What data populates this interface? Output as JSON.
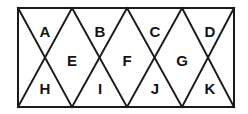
{
  "figure": {
    "name": "triangle-strip-diagram",
    "stroke_color": "#1a1a1a",
    "label_color": "#141414",
    "background_color": "#ffffff",
    "geometry": {
      "left": 18,
      "right": 234,
      "top": 8,
      "bottom": 107,
      "top_vertices_x": [
        18,
        72,
        127,
        182,
        234
      ],
      "bottom_vertices_x": [
        18,
        45,
        100,
        155,
        210,
        234
      ],
      "crossing_y": 57
    },
    "labels": [
      {
        "text": "A",
        "x": 45,
        "y": 31
      },
      {
        "text": "B",
        "x": 100,
        "y": 31
      },
      {
        "text": "C",
        "x": 155,
        "y": 31
      },
      {
        "text": "D",
        "x": 210,
        "y": 31
      },
      {
        "text": "E",
        "x": 72,
        "y": 60
      },
      {
        "text": "F",
        "x": 127,
        "y": 60
      },
      {
        "text": "G",
        "x": 182,
        "y": 60
      },
      {
        "text": "H",
        "x": 45,
        "y": 88
      },
      {
        "text": "I",
        "x": 100,
        "y": 88
      },
      {
        "text": "J",
        "x": 155,
        "y": 88
      },
      {
        "text": "K",
        "x": 210,
        "y": 88
      }
    ],
    "edges": [
      {
        "name": "top-edge",
        "x1": 18,
        "y1": 8,
        "x2": 234,
        "y2": 8
      },
      {
        "name": "bottom-edge",
        "x1": 18,
        "y1": 107,
        "x2": 234,
        "y2": 107
      },
      {
        "name": "left-edge",
        "x1": 18,
        "y1": 8,
        "x2": 18,
        "y2": 107
      },
      {
        "name": "right-edge",
        "x1": 234,
        "y1": 8,
        "x2": 234,
        "y2": 107
      },
      {
        "name": "diag-down-1",
        "x1": 18,
        "y1": 8,
        "x2": 72,
        "y2": 107
      },
      {
        "name": "diag-down-2",
        "x1": 72,
        "y1": 8,
        "x2": 127,
        "y2": 107
      },
      {
        "name": "diag-down-3",
        "x1": 127,
        "y1": 8,
        "x2": 182,
        "y2": 107
      },
      {
        "name": "diag-down-4",
        "x1": 182,
        "y1": 8,
        "x2": 234,
        "y2": 107
      },
      {
        "name": "diag-up-1",
        "x1": 72,
        "y1": 8,
        "x2": 18,
        "y2": 107
      },
      {
        "name": "diag-up-2",
        "x1": 127,
        "y1": 8,
        "x2": 72,
        "y2": 107
      },
      {
        "name": "diag-up-3",
        "x1": 182,
        "y1": 8,
        "x2": 127,
        "y2": 107
      },
      {
        "name": "diag-up-4",
        "x1": 234,
        "y1": 8,
        "x2": 182,
        "y2": 107
      }
    ]
  }
}
